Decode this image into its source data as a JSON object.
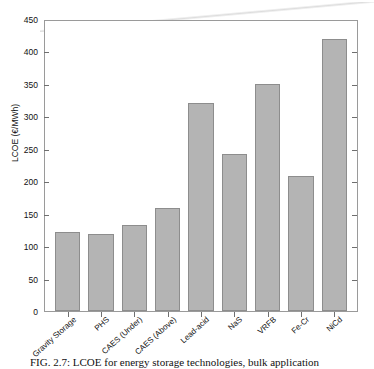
{
  "chart_data": {
    "type": "bar",
    "title": "",
    "xlabel": "",
    "ylabel": "LCOE (€/MWh)",
    "ylim": [
      0,
      450
    ],
    "yticks": [
      0,
      50,
      100,
      150,
      200,
      250,
      300,
      350,
      400,
      450
    ],
    "grid": false,
    "legend": null,
    "categories": [
      "Gravity Storage",
      "PHS",
      "CAES (Under)",
      "CAES (Above)",
      "Lead-acid",
      "NaS",
      "VRFB",
      "Fe-Cr",
      "NiCd"
    ],
    "values": [
      122,
      120,
      134,
      160,
      323,
      244,
      352,
      209,
      422
    ],
    "bar_color": "#b4b4b4",
    "bar_edge_color": "#8d8d8d"
  },
  "caption": {
    "text": "FIG. 2.7: LCOE for energy storage technologies, bulk application"
  }
}
